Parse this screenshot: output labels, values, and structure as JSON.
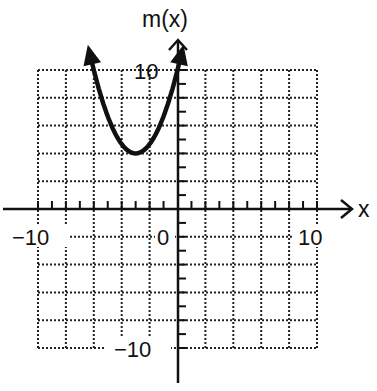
{
  "chart_data": {
    "type": "line",
    "title": "",
    "xlabel": "x",
    "ylabel": "m(x)",
    "xlim": [
      -10,
      10
    ],
    "ylim": [
      -10,
      10
    ],
    "grid": true,
    "grid_style": "dotted",
    "grid_spacing": 2,
    "tick_spacing": 1,
    "tick_labels": {
      "x": [
        "-10",
        "0",
        "10"
      ],
      "y": [
        "10",
        "-10"
      ]
    },
    "series": [
      {
        "name": "m(x)",
        "shape": "parabola opening upward with arrows at both ends",
        "vertex": [
          -3,
          4
        ],
        "x": [
          -6.3,
          -6,
          -5,
          -4,
          -3,
          -2,
          -1,
          0,
          0.3
        ],
        "y": [
          11.3,
          10,
          6.7,
          4.7,
          4,
          4.7,
          6.7,
          10,
          11.3
        ]
      }
    ],
    "legend": "none"
  },
  "axes": {
    "x_label": "x",
    "y_label": "m(x)",
    "x_min_label": "−10",
    "x_zero_label": "0",
    "x_max_label": "10",
    "y_max_label": "10",
    "y_min_label": "−10"
  },
  "colors": {
    "ink": "#111111",
    "background": "#ffffff"
  }
}
